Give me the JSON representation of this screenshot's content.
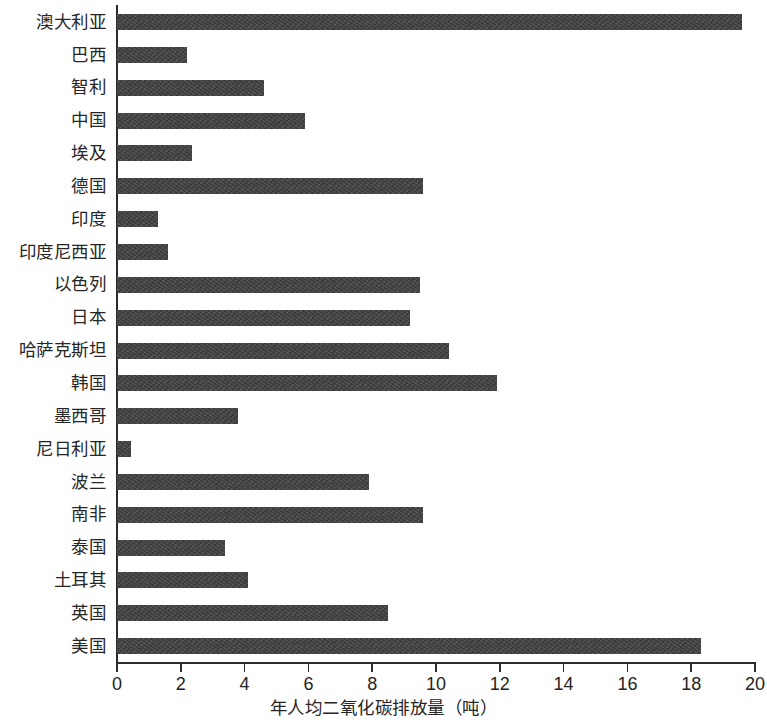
{
  "chart_data": {
    "type": "bar",
    "orientation": "horizontal",
    "title": "",
    "xlabel": "年人均二氧化碳排放量（吨）",
    "ylabel": "",
    "xlim": [
      0,
      20
    ],
    "xticks": [
      0,
      2,
      4,
      6,
      8,
      10,
      12,
      14,
      16,
      18,
      20
    ],
    "xtick_labels": [
      "0",
      "2",
      "4",
      "6",
      "8",
      "10",
      "12",
      "14",
      "16",
      "18",
      "20"
    ],
    "grid": false,
    "legend": null,
    "bar_color": "#3c3c3c",
    "axis_color": "#2b2b2b",
    "categories": [
      "澳大利亚",
      "巴西",
      "智利",
      "中国",
      "埃及",
      "德国",
      "印度",
      "印度尼西亚",
      "以色列",
      "日本",
      "哈萨克斯坦",
      "韩国",
      "墨西哥",
      "尼日利亚",
      "波兰",
      "南非",
      "泰国",
      "土耳其",
      "英国",
      "美国"
    ],
    "values": [
      19.6,
      2.2,
      4.6,
      5.9,
      2.35,
      9.6,
      1.3,
      1.6,
      9.5,
      9.2,
      10.4,
      11.9,
      3.8,
      0.45,
      7.9,
      9.6,
      3.4,
      4.1,
      8.5,
      18.3
    ]
  }
}
